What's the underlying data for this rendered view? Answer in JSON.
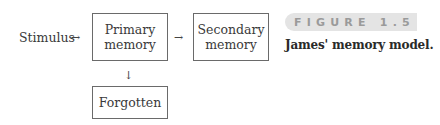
{
  "diagram": {
    "nodes": {
      "stimulus": "Stimulus",
      "primary": "Primary\nmemory",
      "secondary": "Secondary\nmemory",
      "forgotten": "Forgotten"
    },
    "arrows": {
      "right": "→",
      "down": "↓"
    },
    "edges": [
      {
        "from": "Stimulus",
        "to": "Primary memory"
      },
      {
        "from": "Primary memory",
        "to": "Secondary memory"
      },
      {
        "from": "Primary memory",
        "to": "Forgotten"
      }
    ]
  },
  "figure": {
    "label": "FIGURE 1.5",
    "caption": "James' memory model."
  }
}
